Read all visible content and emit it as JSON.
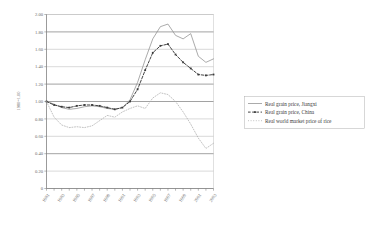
{
  "chart_data": {
    "type": "line",
    "title": "",
    "subtitle": "",
    "xlabel": "",
    "ylabel": "1980=1.00",
    "ylim": [
      0,
      2.0
    ],
    "xlim": [
      1981,
      2003
    ],
    "grid": true,
    "legend_position": "right",
    "y_ticks": [
      "2.00",
      "1.80",
      "1.60",
      "1.40",
      "1.20",
      "1.00",
      "0.80",
      "0.60",
      "0.40",
      "0.20",
      "0"
    ],
    "y_tick_values": [
      2.0,
      1.8,
      1.6,
      1.4,
      1.2,
      1.0,
      0.8,
      0.6,
      0.4,
      0.2,
      0
    ],
    "x_tick_labels": [
      "1981",
      "1983",
      "1985",
      "1987",
      "1989",
      "1991",
      "1993",
      "1995",
      "1997",
      "1999",
      "2001",
      "2003"
    ],
    "x": [
      1981,
      1982,
      1983,
      1984,
      1985,
      1986,
      1987,
      1988,
      1989,
      1990,
      1991,
      1992,
      1993,
      1994,
      1995,
      1996,
      1997,
      1998,
      1999,
      2000,
      2001,
      2002,
      2003
    ],
    "series": [
      {
        "name": "Real grain price, Jiangxi",
        "color": "#8f8f8f",
        "style": "solid",
        "values": [
          1.0,
          0.97,
          0.93,
          0.91,
          0.92,
          0.94,
          0.95,
          0.94,
          0.92,
          0.91,
          0.93,
          1.02,
          1.22,
          1.48,
          1.72,
          1.86,
          1.89,
          1.76,
          1.72,
          1.78,
          1.52,
          1.45,
          1.49
        ]
      },
      {
        "name": "Real grain price, China",
        "color": "#3a3a3a",
        "style": "dashed-marker",
        "values": [
          1.0,
          0.96,
          0.94,
          0.93,
          0.95,
          0.96,
          0.96,
          0.95,
          0.93,
          0.91,
          0.93,
          1.0,
          1.14,
          1.36,
          1.56,
          1.64,
          1.66,
          1.54,
          1.45,
          1.38,
          1.31,
          1.3,
          1.31
        ]
      },
      {
        "name": "Real world market price of rice",
        "color": "#a8a8a8",
        "style": "dotted",
        "values": [
          1.0,
          0.82,
          0.73,
          0.7,
          0.71,
          0.7,
          0.72,
          0.78,
          0.84,
          0.82,
          0.88,
          0.92,
          0.95,
          0.92,
          1.04,
          1.1,
          1.08,
          1.0,
          0.88,
          0.74,
          0.58,
          0.46,
          0.52
        ]
      }
    ]
  },
  "legend": {
    "entries": [
      {
        "label": "Real grain price, Jiangxi"
      },
      {
        "label": "Real grain price, China"
      },
      {
        "label": "Real world market price of rice"
      }
    ]
  }
}
